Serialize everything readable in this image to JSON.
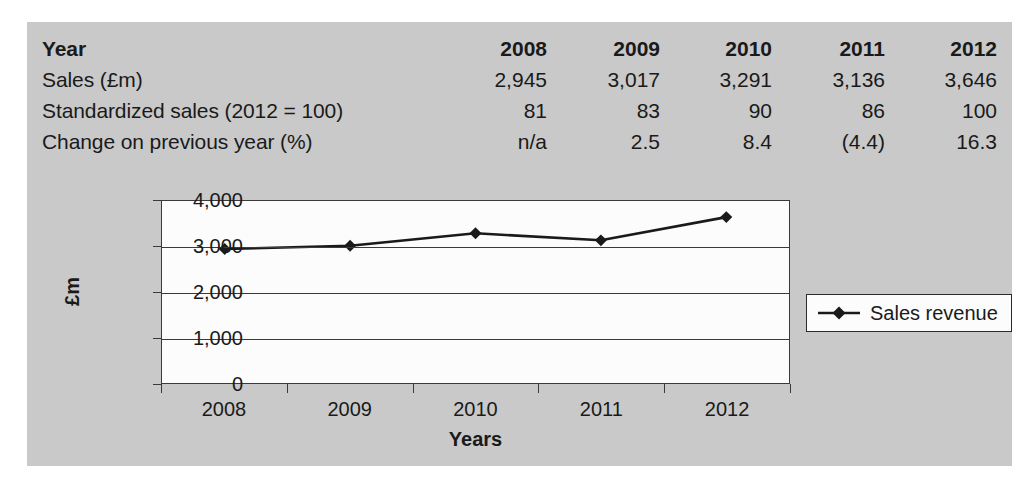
{
  "table": {
    "rows": [
      {
        "label": "Year",
        "values": [
          "2008",
          "2009",
          "2010",
          "2011",
          "2012"
        ],
        "header": true
      },
      {
        "label": "Sales (£m)",
        "values": [
          "2,945",
          "3,017",
          "3,291",
          "3,136",
          "3,646"
        ]
      },
      {
        "label": "Standardized sales (2012 = 100)",
        "values": [
          "81",
          "83",
          "90",
          "86",
          "100"
        ]
      },
      {
        "label": "Change on previous year (%)",
        "values": [
          "n/a",
          "2.5",
          "8.4",
          "(4.4)",
          "16.3"
        ]
      }
    ]
  },
  "chart_data": {
    "type": "line",
    "title": "",
    "xlabel": "Years",
    "ylabel": "£m",
    "categories": [
      "2008",
      "2009",
      "2010",
      "2011",
      "2012"
    ],
    "series": [
      {
        "name": "Sales revenue",
        "values": [
          2945,
          3017,
          3291,
          3136,
          3646
        ]
      }
    ],
    "ylim": [
      0,
      4000
    ],
    "yticks": [
      0,
      1000,
      2000,
      3000,
      4000
    ],
    "ytick_labels": [
      "0",
      "1,000",
      "2,000",
      "3,000",
      "4,000"
    ],
    "grid": true,
    "legend_position": "right",
    "marker": "diamond",
    "line_color": "#1a1a1a",
    "plot_background": "#fcfcfc",
    "panel_background": "#c9c9c9"
  }
}
